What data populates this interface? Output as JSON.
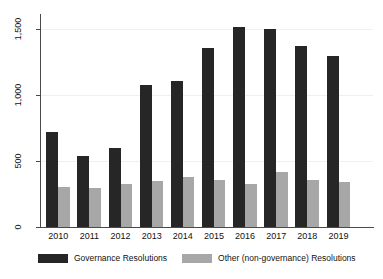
{
  "chart_data": {
    "type": "bar",
    "title": "",
    "categories": [
      "2010",
      "2011",
      "2012",
      "2013",
      "2014",
      "2015",
      "2016",
      "2017",
      "2018",
      "2019"
    ],
    "series": [
      {
        "name": "Governance Resolutions",
        "color": "#262626",
        "values": [
          720,
          540,
          600,
          1080,
          1110,
          1360,
          1520,
          1500,
          1375,
          1300
        ]
      },
      {
        "name": "Other (non-governance) Resolutions",
        "color": "#a7a7a7",
        "values": [
          305,
          295,
          325,
          350,
          380,
          360,
          325,
          420,
          355,
          340
        ]
      }
    ],
    "xlabel": "",
    "ylabel": "",
    "ylim": [
      0,
      1600
    ],
    "yticks": [
      0,
      500,
      1000,
      1500
    ],
    "ytick_labels": [
      "0",
      "500",
      "1,000",
      "1,500"
    ],
    "grid": "faint horizontal gridlines at 500, 1,000, 1,500",
    "legend_position": "bottom"
  },
  "colors": {
    "background": "#ffffff",
    "axis": "#4a4a4a",
    "gridline": "#f0f0f0",
    "text": "#111111"
  }
}
